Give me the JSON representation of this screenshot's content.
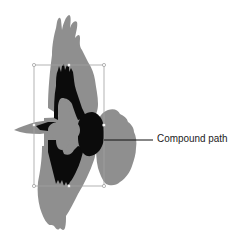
{
  "figure": {
    "callout": {
      "label": "Compound path"
    },
    "colors": {
      "outer_shape": "#8f8f8f",
      "inner_shape": "#0b0b0b",
      "bounding_box": "#a0a0a0",
      "leader_line": "#111111",
      "handle_fill": "#ffffff"
    },
    "bounding_box": {
      "x": 34,
      "y": 65,
      "width": 70,
      "height": 121,
      "handles": 8
    }
  }
}
